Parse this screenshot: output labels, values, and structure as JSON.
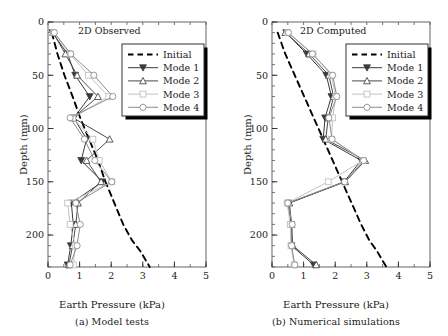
{
  "figure": {
    "axis_x_label": "Earth Pressure (kPa)",
    "axis_y_label": "Depth (mm)"
  },
  "legend": {
    "items": [
      {
        "label": "Initial",
        "marker": "none",
        "style": "dashed",
        "color": "#000000"
      },
      {
        "label": "Mode 1",
        "marker": "triangle-down-filled",
        "style": "solid",
        "color": "#3a3a3a"
      },
      {
        "label": "Mode 2",
        "marker": "triangle-up-open",
        "style": "solid",
        "color": "#4a4a4a"
      },
      {
        "label": "Mode 3",
        "marker": "square-open",
        "style": "solid",
        "color": "#c2c2c2"
      },
      {
        "label": "Mode 4",
        "marker": "circle-open",
        "style": "solid",
        "color": "#8c8c8c"
      }
    ]
  },
  "chart_data": [
    {
      "type": "line",
      "panel": "a",
      "title": "2D Observed",
      "caption": "(a) Model tests",
      "xlabel": "Earth Pressure (kPa)",
      "ylabel": "Depth (mm)",
      "xlim": [
        0,
        5
      ],
      "ylim": [
        0,
        230
      ],
      "y_inverted": true,
      "xticks": [
        0,
        1,
        2,
        3,
        4,
        5
      ],
      "yticks": [
        0,
        50,
        100,
        150,
        200
      ],
      "x_minor_step": 0.5,
      "y_minor_step": 10,
      "grid": false,
      "legend_position": "upper-right-inset",
      "series": [
        {
          "name": "Initial",
          "x": [
            0.12,
            0.3,
            0.52,
            0.78,
            1.02,
            1.3,
            1.58,
            1.82,
            2.1,
            2.38,
            2.66,
            2.92,
            3.12,
            3.22
          ],
          "y": [
            10,
            30,
            50,
            70,
            90,
            110,
            130,
            150,
            170,
            190,
            205,
            215,
            225,
            230
          ]
        },
        {
          "name": "Mode 1",
          "x": [
            0.14,
            0.62,
            0.86,
            1.32,
            0.82,
            1.22,
            1.05,
            1.72,
            0.74,
            0.8,
            0.72,
            0.62
          ],
          "y": [
            10,
            30,
            50,
            70,
            90,
            110,
            130,
            150,
            170,
            190,
            210,
            228
          ]
        },
        {
          "name": "Mode 2",
          "x": [
            0.16,
            0.55,
            0.92,
            1.58,
            0.8,
            1.95,
            1.22,
            1.68,
            0.95,
            0.88,
            0.78,
            0.66
          ],
          "y": [
            10,
            30,
            50,
            70,
            90,
            110,
            130,
            150,
            170,
            190,
            210,
            228
          ]
        },
        {
          "name": "Mode 3",
          "x": [
            0.18,
            0.7,
            1.28,
            1.92,
            0.78,
            1.42,
            1.62,
            2.02,
            0.62,
            0.7,
            0.86,
            0.8
          ],
          "y": [
            10,
            30,
            50,
            70,
            90,
            110,
            130,
            150,
            170,
            190,
            210,
            228
          ]
        },
        {
          "name": "Mode 4",
          "x": [
            0.2,
            0.72,
            1.45,
            2.05,
            0.7,
            1.15,
            1.48,
            2.02,
            0.88,
            1.02,
            0.92,
            0.7
          ],
          "y": [
            10,
            30,
            50,
            70,
            90,
            110,
            130,
            150,
            170,
            190,
            210,
            228
          ]
        }
      ]
    },
    {
      "type": "line",
      "panel": "b",
      "title": "2D Computed",
      "caption": "(b) Numerical simulations",
      "xlabel": "Earth Pressure (kPa)",
      "ylabel": "Depth (mm)",
      "xlim": [
        0,
        5
      ],
      "ylim": [
        0,
        230
      ],
      "y_inverted": true,
      "xticks": [
        0,
        1,
        2,
        3,
        4,
        5
      ],
      "yticks": [
        0,
        50,
        100,
        150,
        200
      ],
      "x_minor_step": 0.5,
      "y_minor_step": 10,
      "grid": false,
      "legend_position": "upper-right-inset",
      "series": [
        {
          "name": "Initial",
          "x": [
            0.18,
            0.42,
            0.72,
            1.02,
            1.32,
            1.62,
            1.92,
            2.22,
            2.52,
            2.82,
            3.08,
            3.32,
            3.52,
            3.62
          ],
          "y": [
            10,
            30,
            50,
            70,
            90,
            110,
            130,
            150,
            170,
            190,
            205,
            215,
            225,
            230
          ]
        },
        {
          "name": "Mode 1",
          "x": [
            0.45,
            1.1,
            1.72,
            1.88,
            1.68,
            1.62,
            2.82,
            2.28,
            0.52,
            0.6,
            0.62,
            1.32
          ],
          "y": [
            10,
            30,
            50,
            70,
            90,
            110,
            130,
            150,
            170,
            190,
            210,
            228
          ]
        },
        {
          "name": "Mode 2",
          "x": [
            0.42,
            1.18,
            1.8,
            1.95,
            1.78,
            1.7,
            2.95,
            2.32,
            0.55,
            0.62,
            0.66,
            1.4
          ],
          "y": [
            10,
            30,
            50,
            70,
            90,
            110,
            130,
            150,
            170,
            190,
            210,
            228
          ]
        },
        {
          "name": "Mode 3",
          "x": [
            0.5,
            1.3,
            1.88,
            2.02,
            1.92,
            1.88,
            2.88,
            1.78,
            0.48,
            0.58,
            0.6,
            0.7
          ],
          "y": [
            10,
            30,
            50,
            70,
            90,
            110,
            130,
            150,
            170,
            190,
            210,
            228
          ]
        },
        {
          "name": "Mode 4",
          "x": [
            0.52,
            1.28,
            1.92,
            2.05,
            1.8,
            1.9,
            2.9,
            2.3,
            0.5,
            0.64,
            0.62,
            0.72
          ],
          "y": [
            10,
            30,
            50,
            70,
            90,
            110,
            130,
            150,
            170,
            190,
            210,
            228
          ]
        }
      ]
    }
  ]
}
